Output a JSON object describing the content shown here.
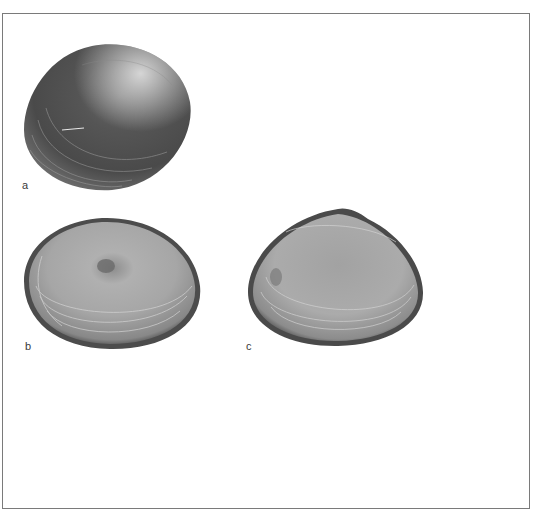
{
  "figure": {
    "panels": [
      {
        "label": "a",
        "view": "exterior",
        "description": "shell exterior, dark grey with concentric growth lines"
      },
      {
        "label": "b",
        "view": "interior",
        "description": "valve interior, pale grey with dark rim"
      },
      {
        "label": "c",
        "view": "interior",
        "description": "valve interior, pale grey with dark rim and hinge"
      }
    ]
  },
  "colors": {
    "frame": "#7a7a7a",
    "shell_dark": "#3e3e3e",
    "shell_mid": "#8a8a8a",
    "shell_light": "#d8d8d8"
  }
}
